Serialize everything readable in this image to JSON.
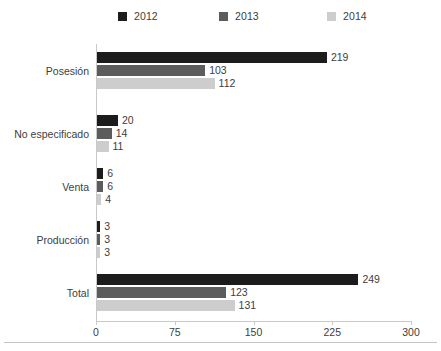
{
  "chart_data": {
    "type": "bar",
    "orientation": "horizontal",
    "title": "",
    "subtitle": "",
    "xlabel": "",
    "ylabel": "",
    "xlim": [
      0,
      300
    ],
    "xticks": [
      0,
      75,
      150,
      225,
      300
    ],
    "xtick_labels": [
      "0",
      "75",
      "150",
      "225",
      "300"
    ],
    "grid": false,
    "legend_position": "top-center",
    "categories": [
      "Posesión",
      "No especificado",
      "Venta",
      "Producción",
      "Total"
    ],
    "series": [
      {
        "name": "2012",
        "color": "#1c1c1c",
        "values": [
          219,
          20,
          6,
          3,
          249
        ]
      },
      {
        "name": "2013",
        "color": "#5c5c5c",
        "values": [
          103,
          14,
          6,
          3,
          123
        ]
      },
      {
        "name": "2014",
        "color": "#cdcdcd",
        "values": [
          112,
          11,
          4,
          3,
          131
        ]
      }
    ],
    "data_labels": [
      [
        "219",
        "103",
        "112"
      ],
      [
        "20",
        "14",
        "11"
      ],
      [
        "6",
        "6",
        "4"
      ],
      [
        "3",
        "3",
        "3"
      ],
      [
        "249",
        "123",
        "131"
      ]
    ]
  },
  "legend": {
    "items": [
      {
        "label": "2012",
        "color": "#1c1c1c"
      },
      {
        "label": "2013",
        "color": "#5c5c5c"
      },
      {
        "label": "2014",
        "color": "#cdcdcd"
      }
    ]
  },
  "axis": {
    "x_tick_labels": [
      "0",
      "75",
      "150",
      "225",
      "300"
    ],
    "max": 300
  },
  "categories": [
    "Posesión",
    "No especificado",
    "Venta",
    "Producción",
    "Total"
  ]
}
